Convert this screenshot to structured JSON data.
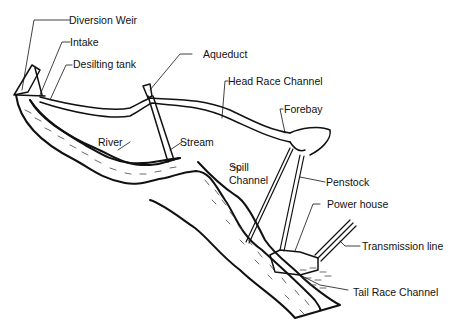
{
  "diagram": {
    "type": "hydropower scheme schematic",
    "labels": {
      "diversion_weir": "Diversion Weir",
      "intake": "Intake",
      "desilting_tank": "Desilting tank",
      "aqueduct": "Aqueduct",
      "head_race_channel": "Head Race Channel",
      "forebay": "Forebay",
      "river": "River",
      "stream": "Stream",
      "spill_channel_1": "Spill",
      "spill_channel_2": "Channel",
      "penstock": "Penstock",
      "power_house": "Power house",
      "transmission_line": "Transmission line",
      "tail_race_channel": "Tail Race Channel"
    },
    "colors": {
      "ink": "#111111",
      "background": "#ffffff"
    }
  }
}
